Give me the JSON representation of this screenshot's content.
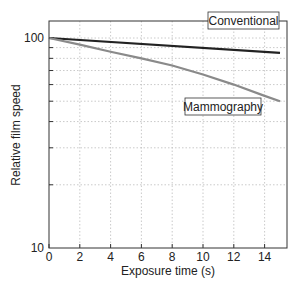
{
  "chart_data": {
    "type": "line",
    "title": "",
    "xlabel": "Exposure time (s)",
    "ylabel": "Relative film speed",
    "xlim": [
      0,
      15.5
    ],
    "ylim": [
      10,
      120
    ],
    "yscale": "log",
    "x_ticks": [
      0,
      2,
      4,
      6,
      8,
      10,
      12,
      14
    ],
    "y_tick_labels": [
      "10",
      "100"
    ],
    "y_minor_ticks": [
      20,
      30,
      40,
      50,
      60,
      70,
      80,
      90
    ],
    "grid": true,
    "series": [
      {
        "name": "Conventional",
        "color": "#222222",
        "x": [
          0,
          15
        ],
        "values": [
          100,
          85
        ]
      },
      {
        "name": "Mammography",
        "color": "#8a8a8a",
        "x": [
          0,
          2,
          4,
          6,
          8,
          10,
          12,
          14,
          15
        ],
        "values": [
          100,
          93,
          86,
          80,
          74,
          67,
          60,
          53,
          50
        ]
      }
    ],
    "annotations": [
      "Conventional",
      "Mammography"
    ]
  }
}
